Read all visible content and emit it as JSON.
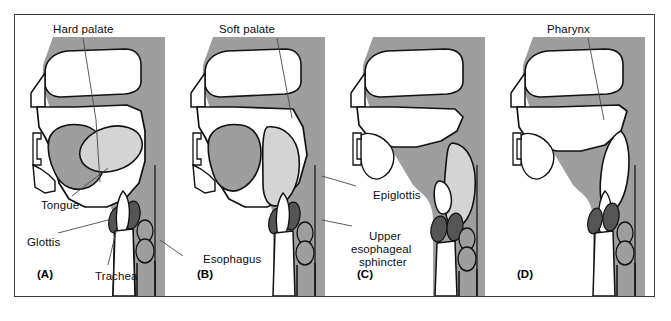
{
  "figure": {
    "type": "anatomical-diagram",
    "panel_count": 4
  },
  "colors": {
    "tissue_gray": "#9e9e9e",
    "airway_white": "#ffffff",
    "bolus_light": "#d4d4d4",
    "glottis_dark": "#555555",
    "outline": "#111111",
    "frame": "#3a3a3a",
    "leader": "#4a4a4a",
    "text": "#0d0d0d"
  },
  "panels": [
    {
      "id": "A",
      "id_label": "(A)",
      "name": "panel-a",
      "stage": "bolus in oral cavity",
      "labels": [
        {
          "key": "hard_palate",
          "text": "Hard palate"
        },
        {
          "key": "tongue",
          "text": "Tongue"
        },
        {
          "key": "glottis",
          "text": "Glottis"
        },
        {
          "key": "trachea",
          "text": "Trachea"
        }
      ]
    },
    {
      "id": "B",
      "id_label": "(B)",
      "name": "panel-b",
      "stage": "soft palate elevates, bolus moves back",
      "labels": [
        {
          "key": "soft_palate",
          "text": "Soft palate"
        },
        {
          "key": "esophagus",
          "text": "Esophagus"
        }
      ]
    },
    {
      "id": "C",
      "id_label": "(C)",
      "name": "panel-c",
      "stage": "epiglottis closes larynx, bolus enters pharynx",
      "labels": [
        {
          "key": "epiglottis",
          "text": "Epiglottis"
        },
        {
          "key": "upper_esophageal_sphincter",
          "text": "Upper esophageal sphincter"
        }
      ]
    },
    {
      "id": "D",
      "id_label": "(D)",
      "name": "panel-d",
      "stage": "bolus passed, airway reopens",
      "labels": [
        {
          "key": "pharynx",
          "text": "Pharynx"
        }
      ]
    }
  ],
  "labels": {
    "hard_palate": "Hard palate",
    "soft_palate": "Soft palate",
    "pharynx": "Pharynx",
    "tongue": "Tongue",
    "glottis": "Glottis",
    "trachea": "Trachea",
    "esophagus": "Esophagus",
    "epiglottis": "Epiglottis",
    "upper_esophageal_sphincter_line1": "Upper",
    "upper_esophageal_sphincter_line2": "esophageal",
    "upper_esophageal_sphincter_line3": "sphincter",
    "panel_a": "(A)",
    "panel_b": "(B)",
    "panel_c": "(C)",
    "panel_d": "(D)"
  }
}
